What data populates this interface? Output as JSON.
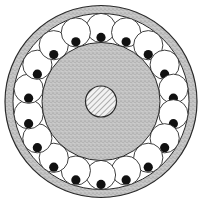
{
  "diagram": {
    "element_count": 18,
    "layers": [
      {
        "name": "outer-ring",
        "fill": "stippled gray"
      },
      {
        "name": "circle-ring",
        "fill": "white circles with black dots"
      },
      {
        "name": "inner-disk",
        "fill": "stippled gray"
      },
      {
        "name": "center-core",
        "fill": "diagonal hatch"
      }
    ],
    "colors": {
      "background": "#ffffff",
      "stipple": "#b8b8b8",
      "stipple_dark": "#8a8a8a",
      "line": "#2a2a2a",
      "ball": "#111111",
      "hatch": "#555555"
    }
  }
}
